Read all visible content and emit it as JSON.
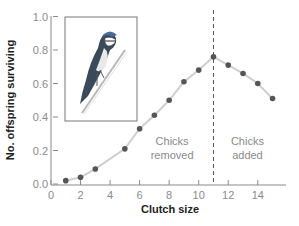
{
  "chart_data": {
    "type": "line",
    "title": "",
    "xlabel": "Clutch size",
    "ylabel": "No. offspring surviving",
    "xlim": [
      0,
      16
    ],
    "ylim": [
      0.0,
      1.0
    ],
    "x_ticks": [
      0,
      2,
      4,
      6,
      8,
      10,
      12,
      14
    ],
    "x_tick_labels": [
      "0",
      "2",
      "4",
      "6",
      "8",
      "10",
      "12",
      "14"
    ],
    "y_ticks": [
      0.0,
      0.2,
      0.4,
      0.6,
      0.8,
      1.0
    ],
    "y_tick_labels": [
      "0.0",
      "0.2",
      "0.4",
      "0.6",
      "0.8",
      "1.0"
    ],
    "grid": false,
    "legend": null,
    "series": [
      {
        "name": "Offspring surviving",
        "x": [
          1,
          2,
          3,
          5,
          6,
          7,
          8,
          9,
          10,
          11,
          12,
          13,
          14,
          15
        ],
        "values": [
          0.02,
          0.04,
          0.09,
          0.21,
          0.33,
          0.41,
          0.5,
          0.61,
          0.68,
          0.76,
          0.71,
          0.66,
          0.6,
          0.51
        ],
        "marker_color": "#555555",
        "line_color": "#cfcfcf"
      }
    ],
    "reference_line": {
      "type": "vertical",
      "x": 11,
      "style": "dashed"
    },
    "annotations": [
      {
        "text_lines": [
          "Chicks",
          "removed"
        ],
        "x": 8.2,
        "y": 0.1
      },
      {
        "text_lines": [
          "Chicks",
          "added"
        ],
        "x": 13.3,
        "y": 0.1
      }
    ],
    "inset": {
      "description": "illustration of a blue tit perched on a twig"
    }
  }
}
